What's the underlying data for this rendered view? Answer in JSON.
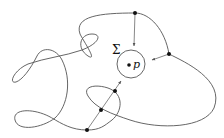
{
  "diagram": {
    "labels": {
      "sigma": "Σ",
      "point": "p"
    },
    "colors": {
      "curve": "#555555",
      "dot": "#111111",
      "background": "#ffffff"
    },
    "elements": {
      "circle": {
        "cx": 131,
        "cy": 64,
        "r": 14,
        "label": "Σ"
      },
      "center_point": {
        "x": 129,
        "y": 65,
        "label": "p"
      },
      "dots": [
        {
          "x": 135,
          "y": 13
        },
        {
          "x": 169,
          "y": 54
        },
        {
          "x": 115,
          "y": 91
        },
        {
          "x": 101,
          "y": 110
        },
        {
          "x": 87,
          "y": 130
        }
      ],
      "arrows": [
        {
          "from": [
            135,
            13
          ],
          "to": [
            134,
            46
          ]
        },
        {
          "from": [
            169,
            54
          ],
          "to": [
            152,
            60
          ]
        },
        {
          "from": [
            87,
            130
          ],
          "to": [
            121,
            81
          ]
        }
      ]
    }
  }
}
